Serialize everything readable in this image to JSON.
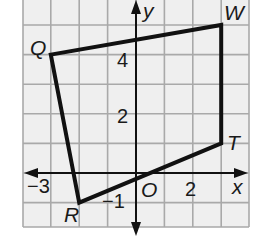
{
  "figure": {
    "type": "coordinate-plane-quadrilateral",
    "grid": {
      "x_min": -4,
      "x_max": 4,
      "y_min": -2,
      "y_max": 6,
      "x_origin_px": 136,
      "y_origin_px": 173,
      "x_step_px": 28.4,
      "y_step_px": 29.6,
      "background_color": "#eeeeee",
      "grid_line_color": "#a8a8a8"
    },
    "axes": {
      "x_label": "x",
      "y_label": "y",
      "origin_label": "O",
      "x_tick_labels": [
        {
          "value": -3,
          "text": "−3"
        },
        {
          "value": 2,
          "text": "2"
        }
      ],
      "y_tick_labels": [
        {
          "value": 4,
          "text": "4"
        },
        {
          "value": 2,
          "text": "2"
        },
        {
          "value": -1,
          "text": "−1"
        }
      ]
    },
    "vertices": [
      {
        "name": "Q",
        "x": -3,
        "y": 4
      },
      {
        "name": "W",
        "x": 3,
        "y": 5
      },
      {
        "name": "T",
        "x": 3,
        "y": 1
      },
      {
        "name": "R",
        "x": -2,
        "y": -1
      }
    ],
    "polygon_order": [
      "Q",
      "W",
      "T",
      "R"
    ],
    "polygon_color": "#111111"
  }
}
